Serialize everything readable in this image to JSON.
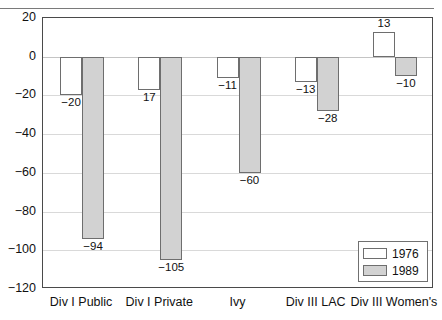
{
  "chart_data": {
    "type": "bar",
    "title": "",
    "xlabel": "",
    "ylabel": "",
    "ylim": [
      -120,
      20
    ],
    "ytick_step": 20,
    "grid": true,
    "legend_position": "bottom-right",
    "categories": [
      "Div I Public",
      "Div I Private",
      "Ivy",
      "Div III LAC",
      "Div III Women's"
    ],
    "yticks": [
      "20",
      "0",
      "−20",
      "−40",
      "−60",
      "−80",
      "−100",
      "−120"
    ],
    "ytick_values": [
      20,
      0,
      -20,
      -40,
      -60,
      -80,
      -100,
      -120
    ],
    "series": [
      {
        "name": "1976",
        "color": "#ffffff",
        "values": [
          -20,
          -17,
          -11,
          -13,
          13
        ],
        "labels": [
          "−20",
          "17",
          "−11",
          "−13",
          "13"
        ]
      },
      {
        "name": "1989",
        "color": "#d2d2d2",
        "values": [
          -94,
          -105,
          -60,
          -28,
          -10
        ],
        "labels": [
          "−94",
          "−105",
          "−60",
          "−28",
          "−10"
        ]
      }
    ]
  },
  "legend": {
    "entries": [
      {
        "label": "1976",
        "swatch": "white-square"
      },
      {
        "label": "1989",
        "swatch": "gray-square"
      }
    ]
  },
  "title_sliver": ""
}
